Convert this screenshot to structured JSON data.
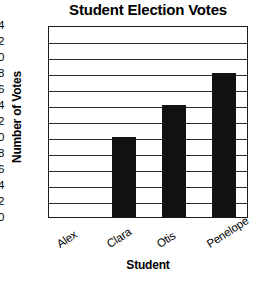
{
  "chart_data": {
    "type": "bar",
    "title": "Student Election Votes",
    "xlabel": "Student",
    "ylabel": "Number of Votes",
    "categories": [
      "Alex",
      "Clara",
      "Otis",
      "Penelope"
    ],
    "values": [
      0,
      10,
      14,
      18
    ],
    "ylim": [
      0,
      24
    ],
    "ytick_labels": [
      "0",
      "2",
      "4",
      "6",
      "8",
      "10",
      "12",
      "14",
      "16",
      "18",
      "20",
      "22",
      "24"
    ],
    "ytick_values": [
      0,
      2,
      4,
      6,
      8,
      10,
      12,
      14,
      16,
      18,
      20,
      22,
      24
    ],
    "grid": true,
    "grid_axis": "y",
    "legend": false,
    "bar_color": "#111111",
    "axis_color": "#1a1a1a",
    "background_color": "#ffffff",
    "series": [
      {
        "name": "Votes",
        "values": [
          0,
          10,
          14,
          18
        ]
      }
    ]
  }
}
